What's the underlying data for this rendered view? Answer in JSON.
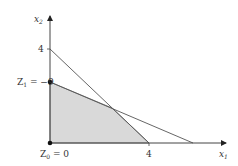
{
  "diagram": {
    "type": "feasible-region-plot",
    "axes": {
      "x": {
        "label": "x",
        "subscript": "1"
      },
      "y": {
        "label": "x",
        "subscript": "2"
      }
    },
    "ticks": {
      "x_tick_label": "4",
      "y_tick_label": "4"
    },
    "points": [
      {
        "name": "Z0",
        "label_main": "Z",
        "label_sub": "0",
        "label_rest": " = 0"
      },
      {
        "name": "Z1",
        "label_main": "Z",
        "label_sub": "1",
        "label_rest": " = −9"
      }
    ],
    "colors": {
      "region_fill": "#d9d9d9",
      "line": "#555555",
      "axis": "#444444",
      "point": "#111111"
    }
  }
}
